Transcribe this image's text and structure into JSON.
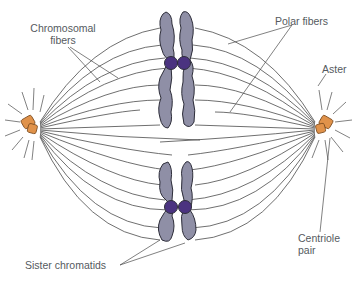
{
  "diagram": {
    "labels": {
      "chromosomal_fibers_line1": "Chromosomal",
      "chromosomal_fibers_line2": "fibers",
      "polar_fibers": "Polar fibers",
      "aster": "Aster",
      "centriole_line1": "Centriole",
      "centriole_line2": "pair",
      "sister_chromatids": "Sister chromatids"
    },
    "colors": {
      "chromatid_fill": "#8f8fa6",
      "chromatid_outline": "#2e2e3a",
      "centromere": "#4b3380",
      "centriole": "#e0924a",
      "centriole_outline": "#7a4a1e",
      "fiber": "#4a4a4a",
      "label_text": "#555a60"
    }
  }
}
